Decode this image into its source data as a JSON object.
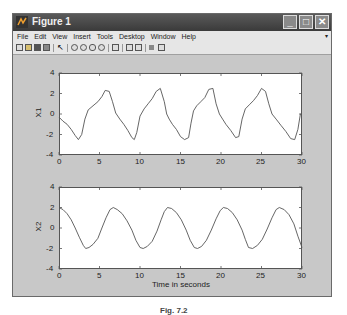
{
  "window": {
    "title": "Figure 1",
    "controls": {
      "minimize": "_",
      "maximize": "□",
      "close": "✕"
    }
  },
  "menubar": {
    "items": [
      "File",
      "Edit",
      "View",
      "Insert",
      "Tools",
      "Desktop",
      "Window",
      "Help"
    ]
  },
  "toolbar": {
    "icons": [
      "new-file-icon",
      "open-file-icon",
      "save-icon",
      "print-icon",
      "pointer-icon",
      "zoom-in-icon",
      "zoom-out-icon",
      "pan-icon",
      "rotate-icon",
      "data-cursor-icon",
      "colorbar-icon",
      "legend-icon",
      "hide-plot-tools-icon",
      "show-plot-tools-icon"
    ]
  },
  "caption": "Fig. 7.2",
  "chart_data": [
    {
      "type": "line",
      "title": "",
      "xlabel": "",
      "ylabel": "X1",
      "xlim": [
        0,
        30
      ],
      "ylim": [
        -4,
        4
      ],
      "xticks": [
        0,
        5,
        10,
        15,
        20,
        25,
        30
      ],
      "yticks": [
        -4,
        -2,
        0,
        2,
        4
      ],
      "grid": false,
      "series": [
        {
          "name": "X1",
          "color": "#555555",
          "x": [
            0,
            0.5,
            1,
            1.5,
            2,
            2.4,
            2.8,
            3.2,
            3.6,
            4.2,
            4.8,
            5.3,
            5.7,
            6.2,
            6.6,
            7.0,
            7.5,
            8.0,
            8.5,
            9.0,
            9.3,
            9.6,
            10.0,
            10.5,
            11.0,
            11.5,
            12.0,
            12.5,
            13.0,
            13.3,
            13.6,
            14.0,
            14.5,
            15.0,
            15.5,
            16.0,
            16.3,
            16.6,
            17.0,
            17.5,
            18.0,
            18.5,
            19.0,
            19.4,
            19.8,
            20.2,
            20.6,
            21.2,
            21.8,
            22.2,
            22.6,
            23.0,
            23.5,
            24.0,
            24.5,
            25.0,
            25.5,
            25.9,
            26.3,
            26.8,
            27.4,
            28.0,
            28.6,
            29.1,
            29.5,
            29.8,
            30.0
          ],
          "y": [
            -0.3,
            -0.7,
            -1.0,
            -1.5,
            -2.1,
            -2.5,
            -2.0,
            -0.5,
            0.4,
            0.8,
            1.2,
            1.7,
            2.3,
            2.2,
            1.2,
            0.1,
            -0.5,
            -1.0,
            -1.6,
            -2.3,
            -2.5,
            -1.8,
            -0.2,
            0.5,
            1.0,
            1.5,
            2.2,
            2.5,
            1.2,
            0.0,
            -0.5,
            -1.0,
            -1.5,
            -2.2,
            -2.5,
            -2.3,
            -0.9,
            0.3,
            0.8,
            1.2,
            1.6,
            2.4,
            2.5,
            1.0,
            0.0,
            -0.5,
            -1.0,
            -1.6,
            -2.3,
            -2.2,
            -0.5,
            0.5,
            0.9,
            1.3,
            1.8,
            2.5,
            2.2,
            1.0,
            0.0,
            -0.5,
            -1.1,
            -1.7,
            -2.4,
            -2.5,
            -1.5,
            0.0,
            0.0
          ]
        }
      ]
    },
    {
      "type": "line",
      "title": "",
      "xlabel": "Time in seconds",
      "ylabel": "X2",
      "xlim": [
        0,
        30
      ],
      "ylim": [
        -4,
        4
      ],
      "xticks": [
        0,
        5,
        10,
        15,
        20,
        25,
        30
      ],
      "yticks": [
        -4,
        -2,
        0,
        2,
        4
      ],
      "grid": false,
      "series": [
        {
          "name": "X2",
          "color": "#555555",
          "x": [
            0,
            0.5,
            1,
            1.5,
            2,
            2.5,
            3.0,
            3.3,
            3.7,
            4.2,
            4.8,
            5.3,
            5.8,
            6.3,
            6.7,
            7.2,
            7.8,
            8.4,
            9.0,
            9.5,
            10.0,
            10.4,
            10.9,
            11.5,
            12.1,
            12.6,
            13.0,
            13.4,
            13.9,
            14.5,
            15.1,
            15.7,
            16.2,
            16.7,
            17.1,
            17.6,
            18.2,
            18.8,
            19.4,
            19.9,
            20.3,
            20.8,
            21.4,
            22.0,
            22.6,
            23.0,
            23.4,
            23.9,
            24.5,
            25.1,
            25.7,
            26.3,
            26.8,
            27.2,
            27.8,
            28.4,
            29.0,
            29.5,
            30.0
          ],
          "y": [
            2.0,
            1.8,
            1.4,
            0.8,
            0.0,
            -0.9,
            -1.7,
            -2.0,
            -1.9,
            -1.6,
            -1.0,
            0.0,
            1.0,
            1.8,
            2.0,
            1.8,
            1.4,
            0.7,
            -0.2,
            -1.2,
            -1.9,
            -2.0,
            -1.8,
            -1.3,
            -0.3,
            0.8,
            1.6,
            2.0,
            1.9,
            1.5,
            0.8,
            -0.2,
            -1.2,
            -1.9,
            -2.0,
            -1.8,
            -1.2,
            -0.2,
            0.9,
            1.7,
            2.0,
            1.9,
            1.5,
            0.8,
            -0.2,
            -1.1,
            -1.9,
            -2.0,
            -1.7,
            -1.1,
            -0.1,
            1.0,
            1.8,
            2.0,
            1.8,
            1.3,
            0.4,
            -0.8,
            -1.9
          ]
        }
      ]
    }
  ]
}
